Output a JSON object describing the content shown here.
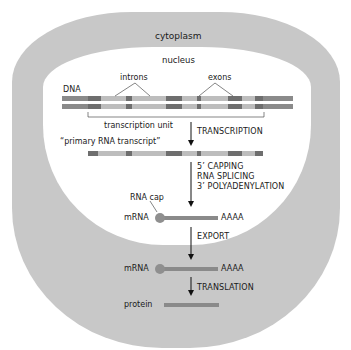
{
  "compartments": {
    "cytoplasm": "cytoplasm",
    "nucleus": "nucleus"
  },
  "dna": {
    "label": "DNA",
    "introns_label": "introns",
    "exons_label": "exons",
    "transcription_unit_label": "transcription unit"
  },
  "steps": {
    "transcription": "TRANSCRIPTION",
    "primary_transcript": "“primary RNA transcript”",
    "processing": [
      "5’ CAPPING",
      "RNA SPLICING",
      "3’ POLYADENYLATION"
    ],
    "rna_cap": "RNA cap",
    "mrna_nuclear": "mRNA",
    "poly_a_nuclear": "AAAA",
    "export": "EXPORT",
    "mrna_cytoplasm": "mRNA",
    "poly_a_cytoplasm": "AAAA",
    "translation": "TRANSLATION",
    "protein": "protein"
  },
  "colors": {
    "cytoplasm": "#c8c8c8",
    "nucleus": "#ffffff",
    "exon": "#6e6e6e",
    "intron": "#bdbdbd",
    "flank": "#8a8a8a",
    "mrna": "#8a8a8a",
    "cap": "#8f8f8f"
  }
}
